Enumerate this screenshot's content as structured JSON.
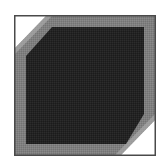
{
  "graphic": {
    "description": "Square frame graphic with diagonal clipped corners",
    "colors": {
      "background": "#ffffff",
      "frame_border": "#4a4a4a",
      "band": "#7f7f7f",
      "interior": "#232323",
      "corner_highlight": "#ffffff"
    }
  }
}
